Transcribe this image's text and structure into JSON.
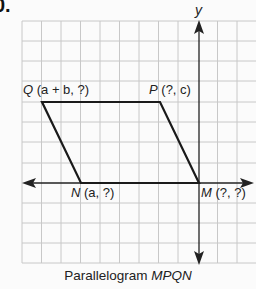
{
  "problem": {
    "number": "0."
  },
  "axes": {
    "y_label": "y"
  },
  "points": {
    "Q": {
      "name": "Q",
      "coords": "(a + b, ?)"
    },
    "P": {
      "name": "P",
      "coords": "(?, c)"
    },
    "N": {
      "name": "N",
      "coords": "(a, ?)"
    },
    "M": {
      "name": "M",
      "coords": "(?, ?)"
    }
  },
  "caption": {
    "prefix": "Parallelogram ",
    "name": "MPQN"
  },
  "colors": {
    "grid": "#c8c8c8",
    "shape": "#1a1a1a",
    "axis": "#222222",
    "background": "#fbfbfb"
  }
}
